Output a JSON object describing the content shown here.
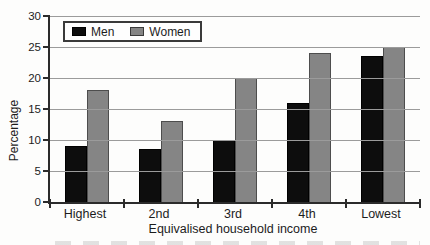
{
  "figure": {
    "background": "#fdfdfc",
    "axis_color": "#2b2b2b",
    "gridline_color": "#9b9b9b"
  },
  "chart_data": {
    "type": "bar",
    "title": "",
    "categories": [
      "Highest",
      "2nd",
      "3rd",
      "4th",
      "Lowest"
    ],
    "series": [
      {
        "name": "Men",
        "color": "#0d0d0d",
        "values": [
          9,
          8.5,
          10,
          16,
          23.5
        ]
      },
      {
        "name": "Women",
        "color": "#858585",
        "values": [
          18,
          13,
          20,
          24,
          25
        ]
      }
    ],
    "xlabel": "Equivalised household income",
    "ylabel": "Percentage",
    "ylim": [
      0,
      30
    ],
    "yticks": [
      0,
      5,
      10,
      15,
      20,
      25,
      30
    ],
    "grid": "horizontal",
    "legend_position": "top-left-inside"
  }
}
